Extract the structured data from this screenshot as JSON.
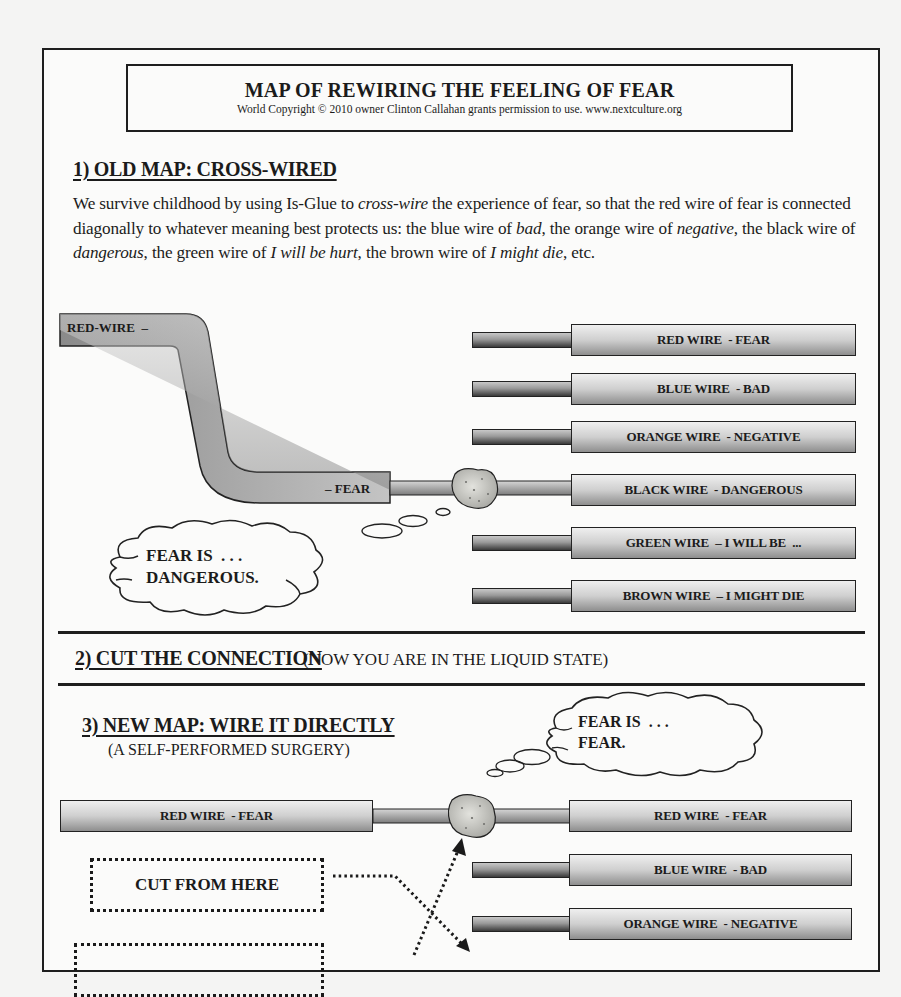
{
  "header": {
    "title": "MAP OF REWIRING THE FEELING OF FEAR",
    "copyright": "World Copyright © 2010 owner Clinton Callahan grants permission to use. www.nextculture.org"
  },
  "section1": {
    "heading": "1) OLD MAP: CROSS-WIRED",
    "paragraph": {
      "p1": "We survive childhood by using Is-Glue to ",
      "i1": "cross-wire",
      "p2": " the experience of fear, so that the red wire of fear is connected diagonally to whatever meaning best protects us: the blue wire of ",
      "i2": "bad",
      "p3": ", the orange wire of ",
      "i3": "negative",
      "p4": ", the black wire of ",
      "i4": "dangerous",
      "p5": ", the green wire of ",
      "i5": "I will be hurt",
      "p6": ", the brown wire of ",
      "i6": "I might die",
      "p7": ", etc."
    },
    "bent_wire": {
      "start_label": "RED-WIRE  –",
      "end_label": "– FEAR"
    },
    "wires": [
      {
        "label": "RED WIRE  - FEAR"
      },
      {
        "label": "BLUE WIRE  - BAD"
      },
      {
        "label": "ORANGE WIRE  - NEGATIVE"
      },
      {
        "label": "BLACK WIRE  - DANGEROUS"
      },
      {
        "label": "GREEN WIRE  – I WILL BE  ..."
      },
      {
        "label": "BROWN WIRE  – I MIGHT DIE"
      }
    ],
    "thought": "FEAR IS  . . .\nDANGEROUS."
  },
  "section2": {
    "heading": "2) CUT THE CONNECTION",
    "note": "(NOW YOU ARE IN THE LIQUID STATE)"
  },
  "section3": {
    "heading": "3) NEW MAP: WIRE IT DIRECTLY",
    "subheading": "(A SELF-PERFORMED SURGERY)",
    "thought": "FEAR IS  . . .\nFEAR.",
    "left_wire": {
      "label": "RED WIRE  - FEAR"
    },
    "wires": [
      {
        "label": "RED WIRE  - FEAR"
      },
      {
        "label": "BLUE WIRE  - BAD"
      },
      {
        "label": "ORANGE WIRE  - NEGATIVE"
      }
    ],
    "cut_box": {
      "label": "CUT FROM HERE"
    },
    "second_box": {
      "label": ""
    }
  },
  "colors": {
    "ink": "#1b1b1b",
    "page": "#fbfbfa",
    "background": "#f4f4f3",
    "wire_light": "#efefef",
    "wire_dark": "#3a3a3a",
    "glue": "#c9c9c4"
  }
}
